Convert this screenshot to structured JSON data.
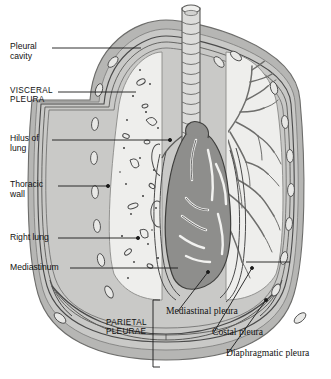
{
  "figure": {
    "colors": {
      "background": "#ffffff",
      "lung": "#eeeeec",
      "lung_edge": "#9a9a9a",
      "thoracic_wall": "#b6b6b4",
      "wall_outer": "#8f8f8d",
      "pleura_line": "#4a4a4a",
      "heart": "#8e8e8c",
      "heart_edge": "#4a4a4a",
      "trachea": "#dcdcda",
      "bronchi": "#b8b8b6",
      "rib": "#e3e3e1",
      "leader": "#1a1a1a",
      "stipple": "#3a3a3a"
    }
  },
  "labels": {
    "left": [
      {
        "id": "pleural-cavity",
        "text": "Pleural\ncavity",
        "style": "sans"
      },
      {
        "id": "visceral-pleura",
        "text": "VISCERAL\nPLEURA",
        "style": "caps"
      },
      {
        "id": "hilus-of-lung",
        "text": "Hilus of\nlung",
        "style": "sans"
      },
      {
        "id": "thoracic-wall",
        "text": "Thoracic\nwall",
        "style": "sans"
      },
      {
        "id": "right-lung",
        "text": "Right lung",
        "style": "sans"
      },
      {
        "id": "mediastinum",
        "text": "Mediastinum",
        "style": "sans"
      }
    ],
    "bottom": [
      {
        "id": "parietal-pleurae",
        "text": "PARIETAL\nPLEURAE",
        "style": "caps"
      },
      {
        "id": "mediastinal-pleura",
        "text": "Mediastinal pleura",
        "style": "serif"
      },
      {
        "id": "costal-pleura",
        "text": "Costal pleura",
        "style": "serif"
      },
      {
        "id": "diaphragmatic-pleura",
        "text": "Diaphragmatic pleura",
        "style": "serif"
      }
    ]
  },
  "structures": {
    "trachea": "trachea",
    "bronchial_tree": "bronchial-tree",
    "heart": "heart",
    "left_lung_field": "left-lung-field",
    "right_lung_field": "right-lung-field",
    "diaphragm": "diaphragm",
    "ribs": "rib-cross-sections",
    "bracket": "parietal-pleurae-bracket"
  }
}
